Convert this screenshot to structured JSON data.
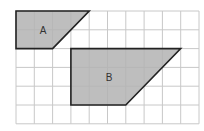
{
  "grid": {
    "cols": 10,
    "rows": 6,
    "x0": 16,
    "y0": 11,
    "cell_w": 18.3,
    "cell_h": 18.8,
    "line_color": "#c8c8c8"
  },
  "shapes": [
    {
      "id": "A",
      "label": "A",
      "fill": "#b3b3b3",
      "stroke": "#222222",
      "points_grid": [
        [
          0,
          0
        ],
        [
          4,
          0
        ],
        [
          2,
          2
        ],
        [
          0,
          2
        ]
      ],
      "label_pos": [
        1.3,
        1.0
      ]
    },
    {
      "id": "B",
      "label": "B",
      "fill": "#b3b3b3",
      "stroke": "#222222",
      "points_grid": [
        [
          3,
          2
        ],
        [
          9,
          2
        ],
        [
          6,
          5
        ],
        [
          3,
          5
        ]
      ],
      "label_pos": [
        4.9,
        3.5
      ]
    }
  ]
}
